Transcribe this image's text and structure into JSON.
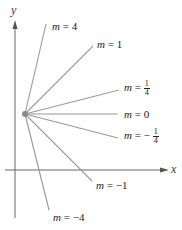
{
  "axes": {
    "x_label": "x",
    "y_label": "y"
  },
  "point": {
    "description": "common point of all lines",
    "color": "#8a8a8a"
  },
  "lines": [
    {
      "slope": "4",
      "label_var": "m",
      "label_eq": "=",
      "label_value": "4"
    },
    {
      "slope": "1",
      "label_var": "m",
      "label_eq": "=",
      "label_value": "1"
    },
    {
      "slope": "1/4",
      "label_var": "m",
      "label_eq": "=",
      "label_sign": "",
      "label_num": "1",
      "label_den": "4"
    },
    {
      "slope": "0",
      "label_var": "m",
      "label_eq": "=",
      "label_value": "0"
    },
    {
      "slope": "-1/4",
      "label_var": "m",
      "label_eq": "=",
      "label_sign": "−",
      "label_num": "1",
      "label_den": "4"
    },
    {
      "slope": "-1",
      "label_var": "m",
      "label_eq": "=",
      "label_value": "−1"
    },
    {
      "slope": "-4",
      "label_var": "m",
      "label_eq": "=",
      "label_value": "−4"
    }
  ],
  "colors": {
    "axis": "#555555",
    "line": "#9a9a9a",
    "text": "#222222"
  }
}
